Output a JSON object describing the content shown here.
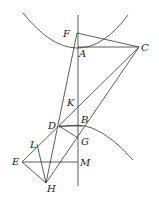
{
  "figure": {
    "type": "geometric-construction",
    "points": {
      "F": {
        "label": "F",
        "x": 77,
        "y": 33,
        "lx": 63,
        "ly": 37
      },
      "A": {
        "label": "A",
        "x": 78,
        "y": 47,
        "lx": 79,
        "ly": 57
      },
      "C": {
        "label": "C",
        "x": 139,
        "y": 47,
        "lx": 141,
        "ly": 51
      },
      "K": {
        "label": "K",
        "x": 78,
        "y": 104,
        "lx": 67,
        "ly": 106
      },
      "D": {
        "label": "D",
        "x": 59,
        "y": 126,
        "lx": 48,
        "ly": 129
      },
      "B": {
        "label": "B",
        "x": 83,
        "y": 126,
        "lx": 81,
        "ly": 123
      },
      "G": {
        "label": "G",
        "x": 78,
        "y": 138,
        "lx": 81,
        "ly": 145
      },
      "L": {
        "label": "L",
        "x": 37,
        "y": 144,
        "lx": 30,
        "ly": 148
      },
      "E": {
        "label": "E",
        "x": 22,
        "y": 162,
        "lx": 12,
        "ly": 165
      },
      "M": {
        "label": "M",
        "x": 78,
        "y": 162,
        "lx": 80,
        "ly": 166
      },
      "H": {
        "label": "H",
        "x": 46,
        "y": 183,
        "lx": 47,
        "ly": 192
      }
    },
    "labels": [
      "F",
      "A",
      "C",
      "K",
      "D",
      "B",
      "G",
      "L",
      "E",
      "M",
      "H"
    ]
  }
}
